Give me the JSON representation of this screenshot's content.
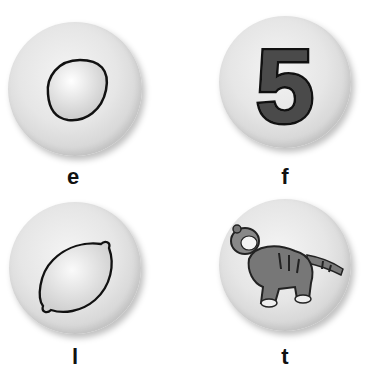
{
  "cards": [
    {
      "letter": "e",
      "picture": "egg-icon"
    },
    {
      "letter": "f",
      "picture": "five-icon",
      "numeral": "5"
    },
    {
      "letter": "l",
      "picture": "lemon-icon"
    },
    {
      "letter": "t",
      "picture": "tiger-icon"
    }
  ]
}
